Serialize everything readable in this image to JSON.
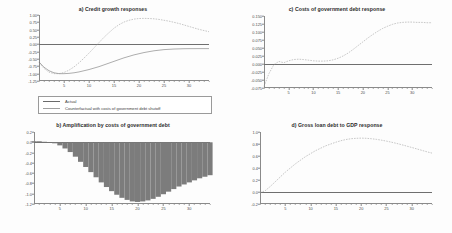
{
  "figure": {
    "background": "#fdfdfd",
    "panel_count": 4
  },
  "legend": {
    "items": [
      {
        "label": "Actual",
        "style": "solid",
        "color": "#6a6a6a"
      },
      {
        "label": "Counterfactual with costs of government debt shutoff",
        "style": "dashed",
        "color": "#9b9b9b"
      }
    ]
  },
  "chart_data": [
    {
      "id": "panel-a",
      "type": "line",
      "title": "a) Credit growth responses",
      "xlabel": "",
      "ylabel": "",
      "xlim": [
        0,
        34
      ],
      "ylim": [
        -1.25,
        1.0
      ],
      "xticks": [
        5,
        10,
        15,
        20,
        25,
        30
      ],
      "yticks": [
        1.0,
        0.75,
        0.5,
        0.25,
        0.0,
        -0.25,
        -0.5,
        -0.75,
        -1.0,
        -1.25
      ],
      "ytick_labels": [
        "1.00",
        "0.75",
        "0.50",
        "0.25",
        "0.00",
        "-0.25",
        "-0.50",
        "-0.75",
        "-1.00",
        "-1.25"
      ],
      "grid": false,
      "zero_line": 0.0,
      "legend_position": "below",
      "x": [
        0,
        1,
        2,
        3,
        4,
        5,
        6,
        7,
        8,
        9,
        10,
        11,
        12,
        13,
        14,
        15,
        16,
        17,
        18,
        19,
        20,
        21,
        22,
        23,
        24,
        25,
        26,
        27,
        28,
        29,
        30,
        31,
        32,
        33,
        34
      ],
      "series": [
        {
          "name": "Actual",
          "style": "solid",
          "values": [
            -0.6,
            -0.78,
            -0.9,
            -0.97,
            -1.0,
            -1.0,
            -0.99,
            -0.97,
            -0.94,
            -0.9,
            -0.86,
            -0.81,
            -0.76,
            -0.7,
            -0.64,
            -0.58,
            -0.52,
            -0.46,
            -0.41,
            -0.36,
            -0.32,
            -0.28,
            -0.25,
            -0.22,
            -0.2,
            -0.18,
            -0.17,
            -0.16,
            -0.155,
            -0.15,
            -0.148,
            -0.147,
            -0.146,
            -0.146,
            -0.146
          ]
        },
        {
          "name": "Counterfactual with costs of government debt shutoff",
          "style": "dashed",
          "values": [
            -0.62,
            -0.82,
            -0.95,
            -1.0,
            -1.0,
            -0.96,
            -0.88,
            -0.77,
            -0.63,
            -0.47,
            -0.3,
            -0.12,
            0.06,
            0.24,
            0.4,
            0.55,
            0.67,
            0.76,
            0.82,
            0.86,
            0.88,
            0.885,
            0.88,
            0.87,
            0.85,
            0.82,
            0.79,
            0.75,
            0.71,
            0.66,
            0.61,
            0.56,
            0.51,
            0.47,
            0.43
          ]
        }
      ]
    },
    {
      "id": "panel-b",
      "type": "bar",
      "title": "b) Amplification by costs of government debt",
      "xlabel": "",
      "ylabel": "",
      "xlim": [
        0,
        34
      ],
      "ylim": [
        -1.2,
        0.2
      ],
      "xticks": [
        5,
        10,
        15,
        20,
        25,
        30
      ],
      "yticks": [
        0.2,
        0.0,
        -0.2,
        -0.4,
        -0.6,
        -0.8,
        -1.0,
        -1.2
      ],
      "ytick_labels": [
        "0.2",
        "0.0",
        "-0.2",
        "-0.4",
        "-0.6",
        "-0.8",
        "-1.0",
        "-1.2"
      ],
      "grid": false,
      "zero_line": 0.0,
      "categories": [
        0,
        1,
        2,
        3,
        4,
        5,
        6,
        7,
        8,
        9,
        10,
        11,
        12,
        13,
        14,
        15,
        16,
        17,
        18,
        19,
        20,
        21,
        22,
        23,
        24,
        25,
        26,
        27,
        28,
        29,
        30,
        31,
        32,
        33,
        34
      ],
      "values": [
        0.02,
        0.02,
        0.01,
        0.0,
        -0.02,
        -0.06,
        -0.12,
        -0.19,
        -0.28,
        -0.38,
        -0.48,
        -0.58,
        -0.68,
        -0.78,
        -0.87,
        -0.95,
        -1.02,
        -1.08,
        -1.12,
        -1.15,
        -1.16,
        -1.15,
        -1.13,
        -1.1,
        -1.06,
        -1.01,
        -0.96,
        -0.91,
        -0.86,
        -0.82,
        -0.78,
        -0.74,
        -0.7,
        -0.67,
        -0.64
      ]
    },
    {
      "id": "panel-c",
      "type": "line",
      "title": "c) Costs of government debt response",
      "xlabel": "",
      "ylabel": "",
      "xlim": [
        0,
        34
      ],
      "ylim": [
        -0.075,
        0.15
      ],
      "xticks": [
        5,
        10,
        15,
        20,
        25,
        30
      ],
      "yticks": [
        0.15,
        0.125,
        0.1,
        0.075,
        0.05,
        0.025,
        0.0,
        -0.025,
        -0.05,
        -0.075
      ],
      "ytick_labels": [
        "0.150",
        "0.125",
        "0.100",
        "0.075",
        "0.050",
        "0.025",
        "0.000",
        "-0.025",
        "-0.050",
        "-0.075"
      ],
      "grid": false,
      "zero_line": 0.0,
      "x": [
        0,
        1,
        2,
        3,
        4,
        5,
        6,
        7,
        8,
        9,
        10,
        11,
        12,
        13,
        14,
        15,
        16,
        17,
        18,
        19,
        20,
        21,
        22,
        23,
        24,
        25,
        26,
        27,
        28,
        29,
        30,
        31,
        32,
        33,
        34
      ],
      "series": [
        {
          "name": "Costs of government debt",
          "style": "dashed",
          "values": [
            -0.07,
            -0.03,
            -0.002,
            0.008,
            0.004,
            0.01,
            0.014,
            0.015,
            0.014,
            0.012,
            0.01,
            0.009,
            0.009,
            0.01,
            0.013,
            0.018,
            0.025,
            0.034,
            0.045,
            0.057,
            0.069,
            0.081,
            0.092,
            0.102,
            0.111,
            0.118,
            0.124,
            0.128,
            0.13,
            0.131,
            0.131,
            0.13,
            0.13,
            0.129,
            0.129
          ]
        }
      ]
    },
    {
      "id": "panel-d",
      "type": "line",
      "title": "d) Gross loan debt to GDP response",
      "xlabel": "",
      "ylabel": "",
      "xlim": [
        0,
        34
      ],
      "ylim": [
        -0.2,
        1.0
      ],
      "xticks": [
        5,
        10,
        15,
        20,
        25,
        30
      ],
      "yticks": [
        1.0,
        0.8,
        0.6,
        0.4,
        0.2,
        0.0,
        -0.2
      ],
      "ytick_labels": [
        "1.0",
        "0.8",
        "0.6",
        "0.4",
        "0.2",
        "0.0",
        "-0.2"
      ],
      "grid": false,
      "zero_line": 0.0,
      "x": [
        0,
        1,
        2,
        3,
        4,
        5,
        6,
        7,
        8,
        9,
        10,
        11,
        12,
        13,
        14,
        15,
        16,
        17,
        18,
        19,
        20,
        21,
        22,
        23,
        24,
        25,
        26,
        27,
        28,
        29,
        30,
        31,
        32,
        33,
        34
      ],
      "series": [
        {
          "name": "Gross loan debt to GDP",
          "style": "dashed",
          "values": [
            -0.01,
            0.02,
            0.09,
            0.17,
            0.25,
            0.33,
            0.4,
            0.47,
            0.53,
            0.59,
            0.64,
            0.69,
            0.73,
            0.77,
            0.8,
            0.83,
            0.855,
            0.875,
            0.888,
            0.895,
            0.898,
            0.895,
            0.888,
            0.878,
            0.864,
            0.848,
            0.83,
            0.81,
            0.788,
            0.765,
            0.742,
            0.718,
            0.694,
            0.67,
            0.648
          ]
        }
      ]
    }
  ]
}
